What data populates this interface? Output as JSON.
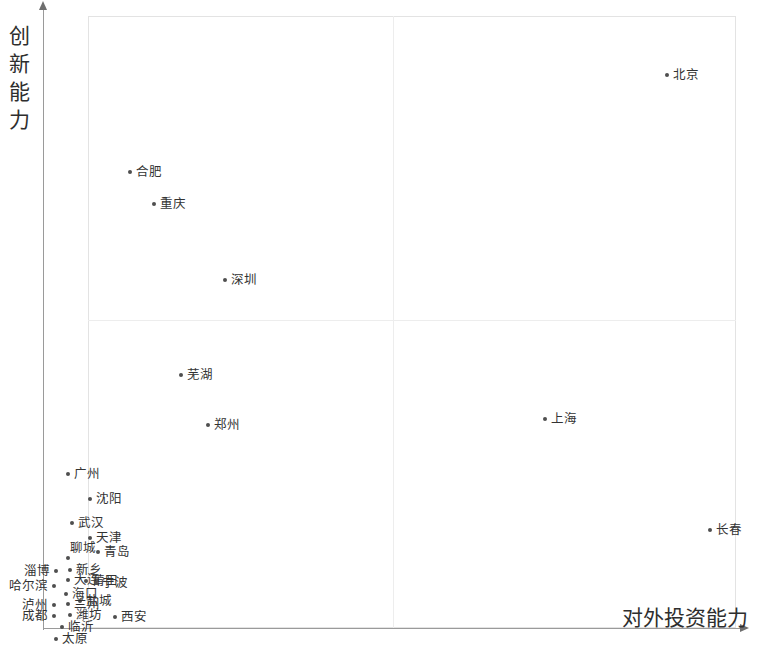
{
  "chart_data": {
    "type": "scatter",
    "title": "",
    "xlabel": "对外投资能力",
    "ylabel": "创新能力",
    "xlim": [
      0,
      100
    ],
    "ylim": [
      0,
      100
    ],
    "grid": false,
    "legend": null,
    "quadrant_divider_x": 50,
    "quadrant_divider_y": 50,
    "points": [
      {
        "label": "北京",
        "x": 89.4,
        "y": 89.5,
        "px": 667,
        "py": 75,
        "lpos": "right"
      },
      {
        "label": "合肥",
        "x": 7.3,
        "y": 73.7,
        "px": 130,
        "py": 172,
        "lpos": "right"
      },
      {
        "label": "重庆",
        "x": 11.0,
        "y": 68.6,
        "px": 154,
        "py": 204,
        "lpos": "right"
      },
      {
        "label": "深圳",
        "x": 21.9,
        "y": 57.0,
        "px": 225,
        "py": 280,
        "lpos": "right"
      },
      {
        "label": "芜湖",
        "x": 15.1,
        "y": 42.2,
        "px": 181,
        "py": 375,
        "lpos": "right"
      },
      {
        "label": "郑州",
        "x": 19.3,
        "y": 35.1,
        "px": 208,
        "py": 425,
        "lpos": "right"
      },
      {
        "label": "上海",
        "x": 70.4,
        "y": 35.6,
        "px": 545,
        "py": 419,
        "lpos": "right"
      },
      {
        "label": "广州",
        "x": 3.1,
        "y": 27.8,
        "px": 68,
        "py": 474,
        "lpos": "right"
      },
      {
        "label": "沈阳",
        "x": 6.5,
        "y": 24.0,
        "px": 90,
        "py": 499,
        "lpos": "right"
      },
      {
        "label": "长春",
        "x": 95.6,
        "y": 19.0,
        "px": 710,
        "py": 530,
        "lpos": "right"
      },
      {
        "label": "武汉",
        "x": 3.7,
        "y": 19.6,
        "px": 72,
        "py": 523,
        "lpos": "right"
      },
      {
        "label": "天津",
        "x": 6.5,
        "y": 17.3,
        "px": 90,
        "py": 538,
        "lpos": "right"
      },
      {
        "label": "青岛",
        "x": 7.7,
        "y": 15.2,
        "px": 98,
        "py": 552,
        "lpos": "right"
      },
      {
        "label": "聊城",
        "x": 3.1,
        "y": 14.2,
        "px": 68,
        "py": 558,
        "lpos": "above"
      },
      {
        "label": "淄博",
        "x": 1.2,
        "y": 12.2,
        "px": 56,
        "py": 571,
        "lpos": "left"
      },
      {
        "label": "新乡",
        "x": 3.4,
        "y": 12.4,
        "px": 70,
        "py": 570,
        "lpos": "right"
      },
      {
        "label": "大连",
        "x": 3.1,
        "y": 10.8,
        "px": 68,
        "py": 580,
        "lpos": "right"
      },
      {
        "label": "莆田",
        "x": 5.9,
        "y": 10.6,
        "px": 86,
        "py": 581,
        "lpos": "right"
      },
      {
        "label": "宁波",
        "x": 7.4,
        "y": 10.3,
        "px": 96,
        "py": 583,
        "lpos": "right"
      },
      {
        "label": "哈尔滨",
        "x": 0.9,
        "y": 9.8,
        "px": 54,
        "py": 586,
        "lpos": "left"
      },
      {
        "label": "海口",
        "x": 2.8,
        "y": 8.6,
        "px": 66,
        "py": 594,
        "lpos": "right"
      },
      {
        "label": "盐城",
        "x": 5.0,
        "y": 7.4,
        "px": 80,
        "py": 601,
        "lpos": "right"
      },
      {
        "label": "兰州",
        "x": 3.1,
        "y": 7.0,
        "px": 68,
        "py": 604,
        "lpos": "right"
      },
      {
        "label": "泸州",
        "x": 0.9,
        "y": 6.8,
        "px": 54,
        "py": 605,
        "lpos": "left"
      },
      {
        "label": "潍坊",
        "x": 3.4,
        "y": 5.2,
        "px": 70,
        "py": 615,
        "lpos": "right"
      },
      {
        "label": "成都",
        "x": 0.9,
        "y": 5.0,
        "px": 54,
        "py": 616,
        "lpos": "left"
      },
      {
        "label": "西安",
        "x": 12.5,
        "y": 4.7,
        "px": 115,
        "py": 617,
        "lpos": "right"
      },
      {
        "label": "临沂",
        "x": 2.2,
        "y": 3.1,
        "px": 62,
        "py": 627,
        "lpos": "right"
      },
      {
        "label": "太原",
        "x": 1.2,
        "y": 0.0,
        "px": 56,
        "py": 639,
        "lpos": "right"
      }
    ]
  },
  "axes": {
    "y_title": "创新能力",
    "x_title": "对外投资能力"
  },
  "colors": {
    "point": "#4f4f4f",
    "label_text": "#333333",
    "axis": "#9a9a9a",
    "frame": "#e3e3e3",
    "quadrant": "#ededed",
    "background": "#ffffff"
  }
}
